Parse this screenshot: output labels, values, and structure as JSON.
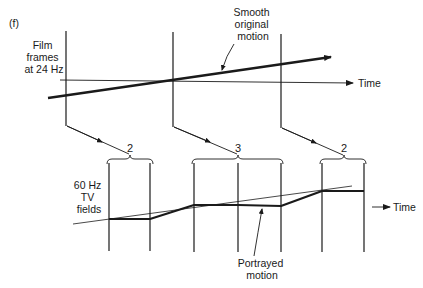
{
  "panel_label": "(f)",
  "top": {
    "label_lines": [
      "Film",
      "frames",
      "at 24 Hz"
    ],
    "time_label": "Time",
    "smooth_label_lines": [
      "Smooth",
      "original",
      "motion"
    ],
    "frame_x": [
      66,
      173,
      281
    ]
  },
  "bottom": {
    "label_lines": [
      "60 Hz",
      "TV",
      "fields"
    ],
    "time_label": "Time",
    "portrayed_label_lines": [
      "Portrayed",
      "motion"
    ],
    "field_x": [
      109,
      150,
      194,
      238,
      281,
      322,
      364
    ],
    "groups": [
      {
        "count": "2",
        "from": 107,
        "to": 153
      },
      {
        "count": "3",
        "from": 192,
        "to": 283
      },
      {
        "count": "2",
        "from": 320,
        "to": 366
      }
    ],
    "portrayed_points": [
      [
        109,
        219
      ],
      [
        150,
        219
      ],
      [
        194,
        205
      ],
      [
        238,
        205
      ],
      [
        281,
        206
      ],
      [
        322,
        191
      ],
      [
        364,
        191
      ]
    ]
  },
  "colors": {
    "ink": "#1a1a1a",
    "background": "#ffffff"
  }
}
